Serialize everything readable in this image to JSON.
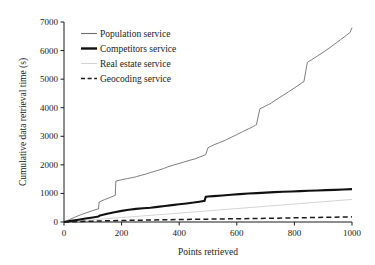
{
  "chart_data": {
    "type": "line",
    "title": "",
    "xlabel": "Points retrieved",
    "ylabel": "Cumulative data retrieval time (s)",
    "xlim": [
      0,
      1000
    ],
    "ylim": [
      0,
      7000
    ],
    "xticks": [
      0,
      200,
      400,
      600,
      800,
      1000
    ],
    "yticks": [
      0,
      1000,
      2000,
      3000,
      4000,
      5000,
      6000,
      7000
    ],
    "xtick_labels": [
      "0",
      "200",
      "400",
      "600",
      "800",
      "1000"
    ],
    "ytick_labels": [
      "0",
      "1000",
      "2000",
      "3000",
      "4000",
      "5000",
      "6000",
      "7000"
    ],
    "grid": false,
    "legend_position": "upper-left",
    "spines": [
      "left",
      "bottom"
    ],
    "series": [
      {
        "name": "Population service",
        "style": "solid",
        "color": "#6e6e6e",
        "width": "thin",
        "final_value": 6800,
        "x": [
          0,
          20,
          40,
          60,
          80,
          100,
          115,
          120,
          122,
          140,
          160,
          175,
          178,
          180,
          200,
          220,
          240,
          250,
          252,
          270,
          285,
          288,
          300,
          320,
          340,
          345,
          348,
          360,
          380,
          400,
          420,
          440,
          455,
          458,
          470,
          480,
          490,
          492,
          500,
          510,
          512,
          520,
          540,
          560,
          565,
          568,
          580,
          600,
          620,
          640,
          655,
          658,
          665,
          668,
          680,
          700,
          710,
          713,
          720,
          740,
          760,
          780,
          800,
          820,
          830,
          833,
          845,
          848,
          860,
          880,
          900,
          920,
          940,
          960,
          980,
          990,
          993,
          1000
        ],
        "y": [
          0,
          90,
          180,
          260,
          330,
          400,
          450,
          455,
          700,
          780,
          860,
          920,
          930,
          1430,
          1480,
          1520,
          1560,
          1580,
          1590,
          1640,
          1680,
          1690,
          1730,
          1790,
          1850,
          1870,
          1880,
          1930,
          1990,
          2050,
          2110,
          2170,
          2210,
          2220,
          2270,
          2310,
          2350,
          2360,
          2600,
          2650,
          2660,
          2700,
          2780,
          2860,
          2890,
          2900,
          2960,
          3060,
          3160,
          3260,
          3330,
          3345,
          3390,
          3400,
          3960,
          4060,
          4110,
          4120,
          4170,
          4300,
          4430,
          4560,
          4690,
          4830,
          4900,
          4910,
          5590,
          5610,
          5680,
          5810,
          5940,
          6080,
          6230,
          6380,
          6530,
          6610,
          6630,
          6800
        ]
      },
      {
        "name": "Competitors service",
        "style": "solid",
        "color": "#111111",
        "width": "thick",
        "final_value": 1150,
        "x": [
          0,
          25,
          50,
          75,
          100,
          120,
          125,
          150,
          175,
          200,
          225,
          250,
          275,
          300,
          325,
          350,
          375,
          400,
          425,
          450,
          470,
          485,
          488,
          492,
          500,
          520,
          550,
          580,
          610,
          640,
          670,
          700,
          730,
          760,
          790,
          820,
          850,
          880,
          910,
          940,
          970,
          1000
        ],
        "y": [
          0,
          40,
          80,
          120,
          160,
          195,
          230,
          290,
          340,
          390,
          430,
          460,
          480,
          500,
          530,
          560,
          590,
          620,
          650,
          680,
          710,
          735,
          740,
          880,
          890,
          905,
          930,
          955,
          975,
          995,
          1012,
          1028,
          1044,
          1058,
          1070,
          1082,
          1093,
          1104,
          1115,
          1126,
          1138,
          1150
        ]
      },
      {
        "name": "Real estate service",
        "style": "solid",
        "color": "#c9c9c9",
        "width": "thin",
        "final_value": 790,
        "x": [
          0,
          100,
          200,
          300,
          400,
          500,
          600,
          700,
          800,
          900,
          1000
        ],
        "y": [
          0,
          78,
          155,
          232,
          310,
          390,
          470,
          550,
          630,
          710,
          790
        ]
      },
      {
        "name": "Geocoding service",
        "style": "dashed",
        "color": "#1a1a1a",
        "width": "medium",
        "final_value": 180,
        "x": [
          0,
          100,
          200,
          300,
          400,
          500,
          600,
          700,
          800,
          900,
          1000
        ],
        "y": [
          0,
          30,
          52,
          70,
          86,
          100,
          114,
          128,
          145,
          162,
          180
        ]
      }
    ]
  },
  "legend": {
    "items": [
      {
        "label": "Population service"
      },
      {
        "label": "Competitors service"
      },
      {
        "label": "Real estate service"
      },
      {
        "label": "Geocoding service"
      }
    ]
  }
}
